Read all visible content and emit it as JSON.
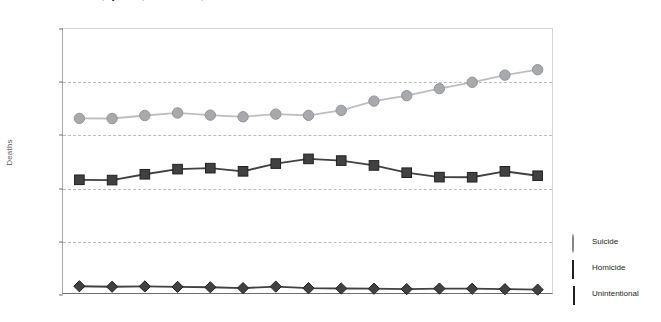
{
  "chart_data": {
    "type": "line",
    "title": "Firearm Deaths, by Intent, United States, 1999-2013",
    "xlabel": "",
    "ylabel": "Deaths",
    "categories": [
      "1999",
      "2000",
      "2001",
      "2002",
      "2003",
      "2004",
      "2005",
      "2006",
      "2007",
      "2008",
      "2009",
      "2010",
      "2011",
      "2012",
      "2013"
    ],
    "ylim": [
      0,
      25000
    ],
    "ytick_values": [
      0,
      5000,
      10000,
      15000,
      20000,
      25000
    ],
    "ytick_labels": [
      "0",
      "5,000",
      "10,000",
      "15,000",
      "20,000",
      "25,000"
    ],
    "grid": true,
    "legend_position": "right",
    "series": [
      {
        "name": "Suicide",
        "marker": "circle",
        "color": "#a7a9ac",
        "line_color": "#bcbec0",
        "values": [
          16599,
          16586,
          16869,
          17108,
          16907,
          16750,
          17002,
          16883,
          17352,
          18223,
          18735,
          19392,
          19990,
          20666,
          21175
        ]
      },
      {
        "name": "Homicide",
        "marker": "square",
        "color": "#414042",
        "line_color": "#414042",
        "values": [
          10828,
          10801,
          11348,
          11829,
          11920,
          11624,
          12352,
          12791,
          12632,
          12179,
          11493,
          11078,
          11068,
          11622,
          11208
        ]
      },
      {
        "name": "Unintentional",
        "marker": "diamond",
        "color": "#414042",
        "line_color": "#414042",
        "values": [
          824,
          776,
          802,
          762,
          730,
          649,
          789,
          642,
          613,
          592,
          554,
          606,
          591,
          548,
          505
        ]
      }
    ]
  },
  "legend": {
    "items": [
      {
        "label": "Suicide",
        "marker": "circle"
      },
      {
        "label": "Homicide",
        "marker": "square"
      },
      {
        "label": "Unintentional",
        "marker": "diamond"
      }
    ]
  }
}
